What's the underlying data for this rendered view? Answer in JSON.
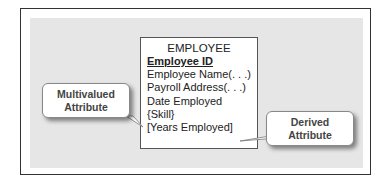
{
  "entity": {
    "name": "EMPLOYEE",
    "primary_key": "Employee ID",
    "attributes": [
      "Employee Name(. . .)",
      "Payroll Address(. . .)",
      "Date Employed",
      "{Skill}",
      "[Years Employed]"
    ]
  },
  "callouts": {
    "multivalued": {
      "line1": "Multivalued",
      "line2": "Attribute"
    },
    "derived": {
      "line1": "Derived",
      "line2": "Attribute"
    }
  }
}
